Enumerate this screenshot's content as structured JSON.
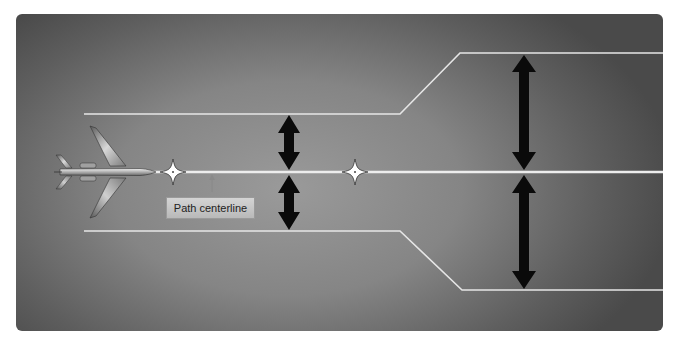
{
  "figure": {
    "label": "Path centerline",
    "colors": {
      "background_center": "#9a9a9a",
      "background_edge": "#4a4a4a",
      "lines": "#e6e6e6",
      "arrows": "#0a0a0a",
      "label_box": "#c8c8c8"
    },
    "elements": {
      "aircraft": "airplane-top-view",
      "waypoints": [
        "waypoint-1",
        "waypoint-2"
      ],
      "narrow_section_arrows": 2,
      "wide_section_arrows": 2
    }
  }
}
